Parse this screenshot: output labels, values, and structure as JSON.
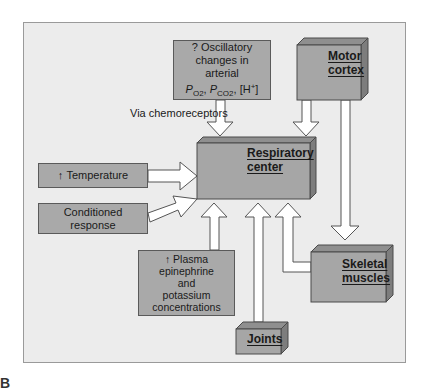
{
  "diagram": {
    "colors": {
      "panel_bg": "#ececec",
      "box_fill": "#a9a9a9",
      "box_side": "#7d7d7d",
      "box_top": "#8f8f8f",
      "arrow_fill": "#ffffff",
      "arrow_stroke": "#555555"
    },
    "nodes": {
      "oscillatory": {
        "line1": "? Oscillatory",
        "line2": "changes in",
        "line3": "arterial",
        "po2_P": "P",
        "po2_sub": "O2",
        "pco2_P": "P",
        "pco2_sub": "CO2",
        "h_plus_base": "[H",
        "h_plus_sup": "+",
        "h_plus_close": "]"
      },
      "via_label": "Via chemoreceptors",
      "motor_cortex": {
        "line1": "Motor",
        "line2": "cortex"
      },
      "respiratory_center": {
        "line1": "Respiratory",
        "line2": "center"
      },
      "temperature": {
        "arrow": "↑",
        "label": "Temperature"
      },
      "conditioned_response": {
        "line1": "Conditioned",
        "line2": "response"
      },
      "plasma": {
        "arrow": "↑",
        "line1": "Plasma",
        "line2": "epinephrine",
        "line3": "and",
        "line4": "potassium",
        "line5": "concentrations"
      },
      "joints": {
        "label": "Joints"
      },
      "skeletal_muscles": {
        "line1": "Skeletal",
        "line2": "muscles"
      }
    },
    "edges": [
      {
        "from": "oscillatory",
        "to": "respiratory_center",
        "label": "Via chemoreceptors"
      },
      {
        "from": "motor_cortex",
        "to": "respiratory_center"
      },
      {
        "from": "motor_cortex",
        "to": "skeletal_muscles"
      },
      {
        "from": "temperature",
        "to": "respiratory_center"
      },
      {
        "from": "conditioned_response",
        "to": "respiratory_center"
      },
      {
        "from": "plasma",
        "to": "respiratory_center"
      },
      {
        "from": "joints",
        "to": "respiratory_center"
      },
      {
        "from": "skeletal_muscles",
        "to": "respiratory_center"
      }
    ],
    "panel_letter": "B"
  }
}
